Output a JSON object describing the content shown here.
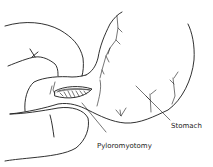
{
  "figure": {
    "labels": {
      "stomach": "Stomach",
      "pyloromyotomy": "Pyloromyotomy"
    }
  }
}
